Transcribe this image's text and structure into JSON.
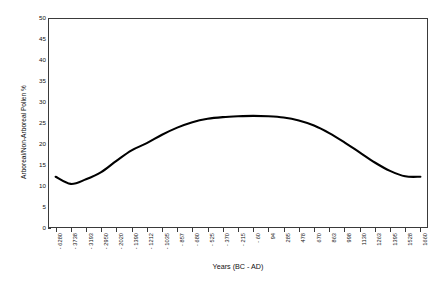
{
  "chart_data": {
    "type": "line",
    "title": "",
    "xlabel": "Years (BC - AD)",
    "ylabel": "Arboreal/Non-Arboreal Pollen %",
    "ylim": [
      0,
      50
    ],
    "ytick_step": 5,
    "yticks": [
      "0",
      "5",
      "10",
      "15",
      "20",
      "25",
      "30",
      "35",
      "40",
      "45",
      "50"
    ],
    "grid": false,
    "legend": null,
    "categories": [
      "- 6280",
      "- 3738",
      "- 3193",
      "- 2950",
      "- 2020",
      "- 1390",
      "- 1212",
      "- 1035",
      "- 857",
      "- 680",
      "- 525",
      "- 370",
      "- 215",
      "- 60",
      "94",
      "285",
      "478",
      "670",
      "863",
      "998",
      "1130",
      "1263",
      "1395",
      "1528",
      "1660"
    ],
    "series": [
      {
        "name": "Arboreal/Non-Arboreal Pollen %",
        "color": "#000000",
        "values": [
          12.2,
          10.5,
          11.6,
          13.3,
          16.0,
          18.5,
          20.2,
          22.2,
          23.9,
          25.2,
          26.0,
          26.4,
          26.6,
          26.7,
          26.6,
          26.3,
          25.6,
          24.4,
          22.6,
          20.4,
          18.0,
          15.6,
          13.6,
          12.3,
          12.2
        ]
      }
    ]
  },
  "axis": {
    "y_title": "Arboreal/Non-Arboreal Pollen %",
    "x_title": "Years (BC - AD)"
  },
  "style": {
    "line_color": "#000000",
    "frame_color": "#3a3a3a",
    "background": "#ffffff"
  }
}
